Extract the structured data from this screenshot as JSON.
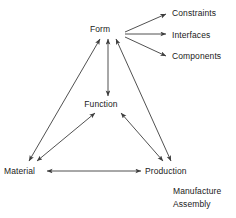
{
  "diagram": {
    "line_color": "#3d3d3d",
    "text_color": "#1a1a1a",
    "background_color": "#ffffff",
    "nodes": [
      {
        "id": "form",
        "label": "Form"
      },
      {
        "id": "function",
        "label": "Function"
      },
      {
        "id": "material",
        "label": "Material"
      },
      {
        "id": "production",
        "label": "Production"
      },
      {
        "id": "constraints",
        "label": "Constraints"
      },
      {
        "id": "interfaces",
        "label": "Interfaces"
      },
      {
        "id": "components",
        "label": "Components"
      },
      {
        "id": "manufacture",
        "label": "Manufacture"
      },
      {
        "id": "assembly",
        "label": "Assembly"
      }
    ],
    "edges": [
      {
        "from": "form",
        "to": "material",
        "style": "bidirectional"
      },
      {
        "from": "form",
        "to": "function",
        "style": "bidirectional"
      },
      {
        "from": "form",
        "to": "production",
        "style": "bidirectional"
      },
      {
        "from": "function",
        "to": "material",
        "style": "bidirectional"
      },
      {
        "from": "function",
        "to": "production",
        "style": "bidirectional"
      },
      {
        "from": "material",
        "to": "production",
        "style": "bidirectional"
      },
      {
        "from": "form",
        "to": "constraints",
        "style": "single"
      },
      {
        "from": "form",
        "to": "interfaces",
        "style": "single"
      },
      {
        "from": "form",
        "to": "components",
        "style": "single"
      }
    ]
  }
}
